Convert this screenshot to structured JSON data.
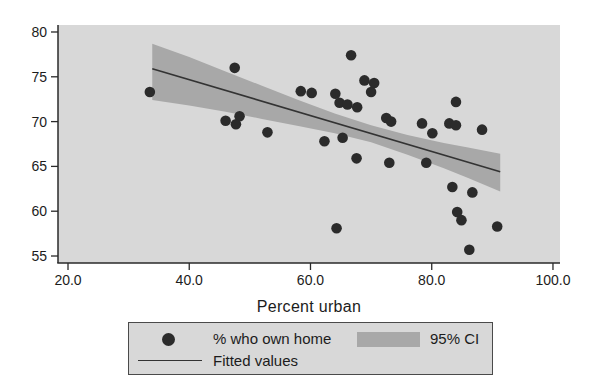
{
  "figure": {
    "xlabel": "Percent urban",
    "legend": {
      "scatter_label": "% who own home",
      "ci_label": "95% CI",
      "fit_label": "Fitted values"
    },
    "colors": {
      "page_bg": "#ffffff",
      "plot_bg": "#d8d8d8",
      "band": "#a8a8a8",
      "dot": "#2b2b2b",
      "line": "#333333",
      "axis": "#2a2a2a",
      "text": "#1c1c1c",
      "legend_bg": "#d8d8d8",
      "legend_border": "#4a4a4a"
    }
  },
  "chart_data": {
    "type": "scatter",
    "title": "",
    "xlabel": "Percent urban",
    "ylabel": "",
    "xlim": [
      18.35,
      101.16
    ],
    "ylim": [
      54.22,
      80.78
    ],
    "x_ticks": [
      20,
      40,
      60,
      80,
      100
    ],
    "x_tick_labels": [
      "20.0",
      "40.0",
      "60.0",
      "80.0",
      "100.0"
    ],
    "y_ticks": [
      55,
      60,
      65,
      70,
      75,
      80
    ],
    "y_tick_labels": [
      "55",
      "60",
      "65",
      "70",
      "75",
      "80"
    ],
    "grid": false,
    "legend_position": "bottom",
    "series": [
      {
        "name": "% who own home",
        "type": "scatter",
        "points": [
          [
            33.5,
            73.3
          ],
          [
            47.5,
            76.0
          ],
          [
            46.0,
            70.1
          ],
          [
            48.3,
            70.6
          ],
          [
            47.7,
            69.7
          ],
          [
            52.9,
            68.8
          ],
          [
            58.4,
            73.4
          ],
          [
            60.2,
            73.2
          ],
          [
            64.1,
            73.1
          ],
          [
            64.8,
            72.1
          ],
          [
            66.7,
            77.4
          ],
          [
            66.1,
            71.9
          ],
          [
            67.7,
            71.6
          ],
          [
            68.9,
            74.6
          ],
          [
            70.5,
            74.3
          ],
          [
            70.0,
            73.3
          ],
          [
            62.3,
            67.8
          ],
          [
            65.3,
            68.2
          ],
          [
            67.6,
            65.9
          ],
          [
            73.0,
            65.4
          ],
          [
            64.3,
            58.1
          ],
          [
            72.5,
            70.4
          ],
          [
            73.3,
            70.0
          ],
          [
            78.4,
            69.8
          ],
          [
            82.9,
            69.8
          ],
          [
            84.0,
            69.6
          ],
          [
            80.1,
            68.7
          ],
          [
            84.0,
            72.2
          ],
          [
            88.3,
            69.1
          ],
          [
            79.1,
            65.4
          ],
          [
            83.4,
            62.7
          ],
          [
            86.7,
            62.1
          ],
          [
            84.2,
            59.9
          ],
          [
            84.9,
            59.0
          ],
          [
            90.8,
            58.3
          ],
          [
            86.2,
            55.7
          ]
        ]
      },
      {
        "name": "Fitted values",
        "type": "line",
        "x": [
          33.9,
          91.3
        ],
        "y": [
          75.9,
          64.4
        ]
      },
      {
        "name": "95% CI",
        "type": "band",
        "x": [
          33.9,
          40.0,
          46.0,
          52.0,
          58.0,
          64.0,
          70.0,
          76.0,
          82.0,
          86.0,
          91.3
        ],
        "upper": [
          78.7,
          77.2,
          75.6,
          74.0,
          72.4,
          70.9,
          69.6,
          68.5,
          67.6,
          67.1,
          66.4
        ],
        "lower": [
          72.4,
          71.8,
          71.1,
          70.3,
          69.5,
          68.7,
          67.7,
          66.3,
          64.8,
          63.7,
          62.2
        ]
      }
    ]
  }
}
